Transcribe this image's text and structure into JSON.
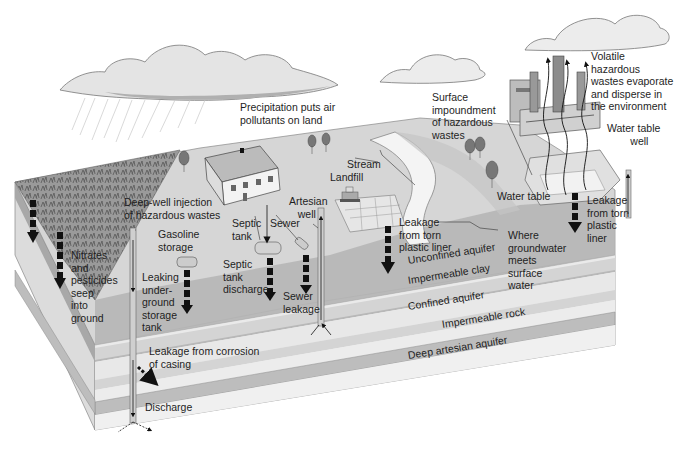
{
  "diagram": {
    "colors": {
      "background": "#ffffff",
      "cloud": "#e6e6e6",
      "cloud_shade": "#b5b5b5",
      "surface": "#d2d2d2",
      "farmland": "#8e8e8e",
      "topsoil": "#b4b4b4",
      "unconfined_aquifer": "#e8e8e8",
      "impermeable_clay": "#d6d6d6",
      "confined_aquifer": "#ececec",
      "impermeable_rock": "#bdbdbd",
      "deep_aquifer": "#efefef",
      "stream": "#f2f2f2",
      "arrow": "#111111",
      "pipe": "#c8c8c8"
    },
    "labels": {
      "precipitation": "Precipitation puts air\npollutants on land",
      "volatile": "Volatile\nhazardous\nwastes evaporate\nand disperse in\nthe environment",
      "surface_impoundment": "Surface\nimpoundment\nof hazardous\nwastes",
      "water_table_well": "Water table\n        well",
      "stream": "Stream",
      "landfill": "Landfill",
      "deep_well": "Deep-well injection\nof hazardous wastes",
      "artesian_well": "Artesian\n   well",
      "septic_tank": "Septic\ntank",
      "sewer": "Sewer",
      "gasoline_storage": "Gasoline\nstorage",
      "nitrates": "Nitrates\nand\npesticides\nseep\ninto\nground",
      "leaking_tank": "Leaking\nunder-\nground\nstorage\ntank",
      "septic_discharge": "Septic\ntank\ndischarge",
      "sewer_leakage": "Sewer\nleakage",
      "water_table": "Water table",
      "leakage_liner_left": "Leakage\nfrom torn\nplastic liner",
      "leakage_liner_right": "Leakage\nfrom torn\nplastic\nliner",
      "where_groundwater": "Where\ngroundwater\nmeets\nsurface\nwater",
      "unconfined_aquifer": "Unconfined aquifer",
      "impermeable_clay": "Impermeable clay",
      "confined_aquifer": "Confined aquifer",
      "impermeable_rock": "Impermeable rock",
      "deep_artesian_aquifer": "Deep artesian aquifer",
      "leakage_corrosion": "Leakage from corrosion\nof casing",
      "discharge": "Discharge"
    },
    "layers": [
      "Unconfined aquifer",
      "Impermeable clay",
      "Confined aquifer",
      "Impermeable rock",
      "Deep artesian aquifer"
    ],
    "icons": [
      "cloud-icon",
      "rain-icon",
      "house-icon",
      "tree-icon",
      "factory-icon",
      "smokestack-icon",
      "well-pipe-icon",
      "storage-tank-icon",
      "septic-tank-icon",
      "sewer-pipe-icon",
      "landfill-icon",
      "bulldozer-icon",
      "stream-icon",
      "down-arrow-icon",
      "up-arrow-icon",
      "wavy-arrow-icon"
    ]
  }
}
